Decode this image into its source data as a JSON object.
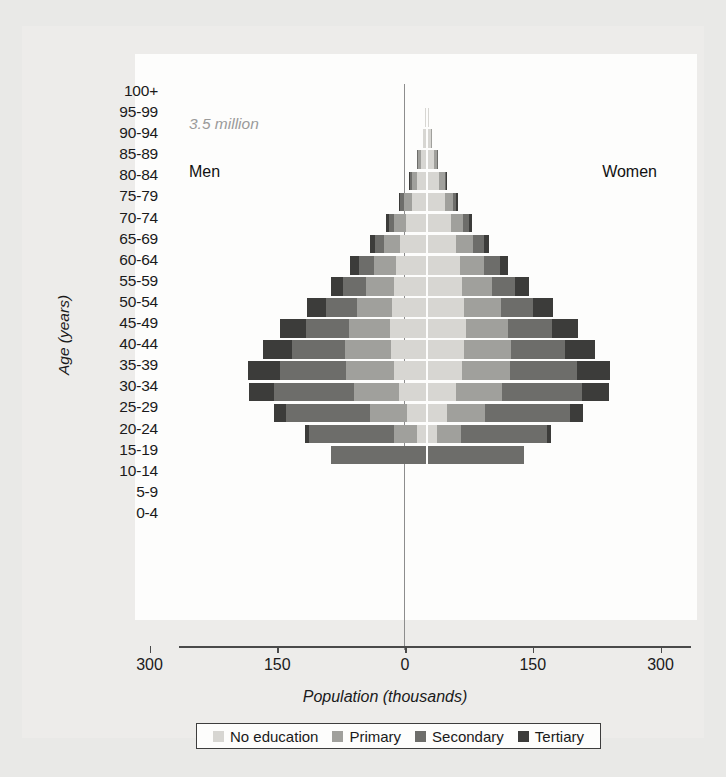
{
  "figure": {
    "annotation_total": "3.5 million",
    "label_left": "Men",
    "label_right": "Women"
  },
  "chart_data": {
    "type": "bar",
    "subtype": "population-pyramid-stacked",
    "title": "",
    "xlabel": "Population (thousands)",
    "ylabel": "Age (years)",
    "xlim": [
      -300,
      300
    ],
    "xticks": [
      -300,
      -150,
      0,
      150,
      300
    ],
    "xtick_labels": [
      "300",
      "150",
      "0",
      "150",
      "300"
    ],
    "grid": false,
    "legend_position": "bottom",
    "annotations": [
      "3.5 million",
      "Men",
      "Women"
    ],
    "side_labels": {
      "left": "Men",
      "right": "Women"
    },
    "categories": [
      "100+",
      "95-99",
      "90-94",
      "85-89",
      "80-84",
      "75-79",
      "70-74",
      "65-69",
      "60-64",
      "55-59",
      "50-54",
      "45-49",
      "40-44",
      "35-39",
      "30-34",
      "25-29",
      "20-24",
      "15-19",
      "10-14",
      "5-9",
      "0-4"
    ],
    "series": [
      {
        "name": "No education",
        "color": "#d7d6d2"
      },
      {
        "name": "Primary",
        "color": "#a0a09c"
      },
      {
        "name": "Secondary",
        "color": "#6d6d6a"
      },
      {
        "name": "Tertiary",
        "color": "#3c3c3a"
      }
    ],
    "men": {
      "100+": {
        "No education": 0,
        "Primary": 0,
        "Secondary": 0,
        "Tertiary": 0
      },
      "95-99": {
        "No education": 1,
        "Primary": 0,
        "Secondary": 0,
        "Tertiary": 0
      },
      "90-94": {
        "No education": 3,
        "Primary": 1,
        "Secondary": 0,
        "Tertiary": 0
      },
      "85-89": {
        "No education": 6,
        "Primary": 3,
        "Secondary": 1,
        "Tertiary": 0
      },
      "80-84": {
        "No education": 11,
        "Primary": 6,
        "Secondary": 2,
        "Tertiary": 1
      },
      "75-79": {
        "No education": 17,
        "Primary": 9,
        "Secondary": 4,
        "Tertiary": 2
      },
      "70-74": {
        "No education": 24,
        "Primary": 13,
        "Secondary": 7,
        "Tertiary": 3
      },
      "65-69": {
        "No education": 30,
        "Primary": 19,
        "Secondary": 11,
        "Tertiary": 6
      },
      "60-64": {
        "No education": 35,
        "Primary": 26,
        "Secondary": 18,
        "Tertiary": 10
      },
      "55-59": {
        "No education": 38,
        "Primary": 33,
        "Secondary": 26,
        "Tertiary": 15
      },
      "50-54": {
        "No education": 40,
        "Primary": 41,
        "Secondary": 37,
        "Tertiary": 22
      },
      "45-49": {
        "No education": 42,
        "Primary": 49,
        "Secondary": 50,
        "Tertiary": 30
      },
      "40-44": {
        "No education": 41,
        "Primary": 54,
        "Secondary": 62,
        "Tertiary": 35
      },
      "35-39": {
        "No education": 38,
        "Primary": 56,
        "Secondary": 78,
        "Tertiary": 37
      },
      "30-34": {
        "No education": 32,
        "Primary": 53,
        "Secondary": 93,
        "Tertiary": 30
      },
      "25-29": {
        "No education": 22,
        "Primary": 44,
        "Secondary": 98,
        "Tertiary": 15
      },
      "20-24": {
        "No education": 10,
        "Primary": 27,
        "Secondary": 100,
        "Tertiary": 5
      },
      "15-19": {
        "No education": 0,
        "Primary": 0,
        "Secondary": 112,
        "Tertiary": 0
      },
      "10-14": {
        "No education": 0,
        "Primary": 0,
        "Secondary": 0,
        "Tertiary": 0
      },
      "5-9": {
        "No education": 0,
        "Primary": 0,
        "Secondary": 0,
        "Tertiary": 0
      },
      "0-4": {
        "No education": 0,
        "Primary": 0,
        "Secondary": 0,
        "Tertiary": 0
      }
    },
    "women": {
      "100+": {
        "No education": 0,
        "Primary": 0,
        "Secondary": 0,
        "Tertiary": 0
      },
      "95-99": {
        "No education": 1,
        "Primary": 0,
        "Secondary": 0,
        "Tertiary": 0
      },
      "90-94": {
        "No education": 4,
        "Primary": 1,
        "Secondary": 0,
        "Tertiary": 0
      },
      "85-89": {
        "No education": 8,
        "Primary": 3,
        "Secondary": 1,
        "Tertiary": 0
      },
      "80-84": {
        "No education": 14,
        "Primary": 6,
        "Secondary": 2,
        "Tertiary": 1
      },
      "75-79": {
        "No education": 21,
        "Primary": 9,
        "Secondary": 4,
        "Tertiary": 2
      },
      "70-74": {
        "No education": 28,
        "Primary": 14,
        "Secondary": 7,
        "Tertiary": 3
      },
      "65-69": {
        "No education": 34,
        "Primary": 20,
        "Secondary": 12,
        "Tertiary": 6
      },
      "60-64": {
        "No education": 38,
        "Primary": 28,
        "Secondary": 19,
        "Tertiary": 10
      },
      "55-59": {
        "No education": 41,
        "Primary": 35,
        "Secondary": 27,
        "Tertiary": 16
      },
      "50-54": {
        "No education": 43,
        "Primary": 43,
        "Secondary": 38,
        "Tertiary": 23
      },
      "45-49": {
        "No education": 45,
        "Primary": 50,
        "Secondary": 51,
        "Tertiary": 31
      },
      "40-44": {
        "No education": 43,
        "Primary": 55,
        "Secondary": 63,
        "Tertiary": 36
      },
      "35-39": {
        "No education": 40,
        "Primary": 57,
        "Secondary": 79,
        "Tertiary": 38
      },
      "30-34": {
        "No education": 34,
        "Primary": 54,
        "Secondary": 94,
        "Tertiary": 31
      },
      "25-29": {
        "No education": 23,
        "Primary": 45,
        "Secondary": 99,
        "Tertiary": 16
      },
      "20-24": {
        "No education": 11,
        "Primary": 28,
        "Secondary": 101,
        "Tertiary": 5
      },
      "15-19": {
        "No education": 0,
        "Primary": 0,
        "Secondary": 113,
        "Tertiary": 0
      },
      "10-14": {
        "No education": 0,
        "Primary": 0,
        "Secondary": 0,
        "Tertiary": 0
      },
      "5-9": {
        "No education": 0,
        "Primary": 0,
        "Secondary": 0,
        "Tertiary": 0
      },
      "0-4": {
        "No education": 0,
        "Primary": 0,
        "Secondary": 0,
        "Tertiary": 0
      }
    }
  },
  "legend": {
    "items": [
      {
        "label": "No education",
        "color": "#d7d6d2"
      },
      {
        "label": "Primary",
        "color": "#a0a09c"
      },
      {
        "label": "Secondary",
        "color": "#6d6d6a"
      },
      {
        "label": "Tertiary",
        "color": "#3c3c3a"
      }
    ]
  }
}
